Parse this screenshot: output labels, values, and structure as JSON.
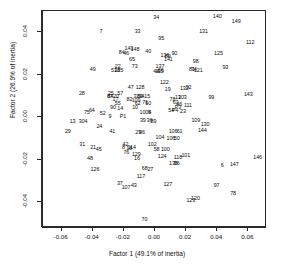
{
  "chart_data": {
    "type": "scatter",
    "title": "",
    "xlabel": "Factor 1 (49.1% of inertia)",
    "ylabel": "Factor 2 (26.9% of inertia)",
    "xlim": [
      -0.072,
      0.072
    ],
    "ylim": [
      -0.052,
      0.05
    ],
    "xticks": [
      -0.06,
      -0.04,
      -0.02,
      0.0,
      0.02,
      0.04,
      0.06
    ],
    "xticklabels": [
      "-0.06",
      "-0.04",
      "-0.02",
      "0.00",
      "0.02",
      "0.04",
      "0.06"
    ],
    "yticks": [
      -0.04,
      -0.02,
      0.0,
      0.02,
      0.04
    ],
    "yticklabels": [
      "-0.04",
      "-0.02",
      "0.00",
      "0.02",
      "0.04"
    ],
    "grid": false,
    "legend": false,
    "point_style": "text-labels",
    "points": [
      {
        "label": "34",
        "x": 0.0008,
        "y": 0.0468
      },
      {
        "label": "140",
        "x": 0.04,
        "y": 0.047
      },
      {
        "label": "149",
        "x": 0.0522,
        "y": 0.045
      },
      {
        "label": "7",
        "x": -0.0348,
        "y": 0.04
      },
      {
        "label": "33",
        "x": -0.0112,
        "y": 0.0402
      },
      {
        "label": "131",
        "x": 0.0312,
        "y": 0.04
      },
      {
        "label": "95",
        "x": 0.004,
        "y": 0.037
      },
      {
        "label": "112",
        "x": 0.0612,
        "y": 0.0348
      },
      {
        "label": "143",
        "x": -0.0168,
        "y": 0.032
      },
      {
        "label": "148",
        "x": -0.0128,
        "y": 0.0318
      },
      {
        "label": "84",
        "x": -0.0214,
        "y": 0.0302
      },
      {
        "label": "46",
        "x": -0.0186,
        "y": 0.03
      },
      {
        "label": "40",
        "x": -0.0044,
        "y": 0.0305
      },
      {
        "label": "136",
        "x": 0.0063,
        "y": 0.0288
      },
      {
        "label": "89",
        "x": 0.0082,
        "y": 0.0284
      },
      {
        "label": "90",
        "x": 0.0124,
        "y": 0.0296
      },
      {
        "label": "125",
        "x": 0.0408,
        "y": 0.03
      },
      {
        "label": "65",
        "x": -0.0148,
        "y": 0.0268
      },
      {
        "label": "141",
        "x": 0.0086,
        "y": 0.0268
      },
      {
        "label": "98",
        "x": 0.0262,
        "y": 0.0258
      },
      {
        "label": "22",
        "x": -0.024,
        "y": 0.0238
      },
      {
        "label": "73",
        "x": -0.013,
        "y": 0.0236
      },
      {
        "label": "137",
        "x": 0.0032,
        "y": 0.0238
      },
      {
        "label": "93",
        "x": 0.0452,
        "y": 0.0232
      },
      {
        "label": "49",
        "x": -0.04,
        "y": 0.0224
      },
      {
        "label": "51",
        "x": -0.0264,
        "y": 0.0218
      },
      {
        "label": "38",
        "x": -0.0244,
        "y": 0.0218
      },
      {
        "label": "35",
        "x": -0.0224,
        "y": 0.0216
      },
      {
        "label": "81",
        "x": 0.0238,
        "y": 0.0222
      },
      {
        "label": "74",
        "x": 0.025,
        "y": 0.0222
      },
      {
        "label": "121",
        "x": 0.0278,
        "y": 0.0218
      },
      {
        "label": "44",
        "x": 0.0008,
        "y": 0.0212
      },
      {
        "label": "66",
        "x": 0.0038,
        "y": 0.0216
      },
      {
        "label": "115",
        "x": 0.0028,
        "y": 0.0214
      },
      {
        "label": "122",
        "x": 0.006,
        "y": 0.016
      },
      {
        "label": "47",
        "x": -0.0156,
        "y": 0.014
      },
      {
        "label": "128",
        "x": -0.0096,
        "y": 0.014
      },
      {
        "label": "19",
        "x": 0.0082,
        "y": 0.0128
      },
      {
        "label": "132",
        "x": 0.0188,
        "y": 0.0132
      },
      {
        "label": "92",
        "x": 0.0216,
        "y": 0.0136
      },
      {
        "label": "28",
        "x": -0.047,
        "y": 0.0108
      },
      {
        "label": "25",
        "x": -0.0284,
        "y": 0.0108
      },
      {
        "label": "57",
        "x": -0.0224,
        "y": 0.0108
      },
      {
        "label": "20",
        "x": -0.025,
        "y": 0.0096
      },
      {
        "label": "143b",
        "x": 0.06,
        "y": 0.0104
      },
      {
        "label": "32",
        "x": -0.012,
        "y": 0.0098
      },
      {
        "label": "60",
        "x": -0.0096,
        "y": 0.0096
      },
      {
        "label": "94",
        "x": -0.0086,
        "y": 0.0094
      },
      {
        "label": "15",
        "x": -0.005,
        "y": 0.0098
      },
      {
        "label": "99",
        "x": 0.0362,
        "y": 0.0092
      },
      {
        "label": "67",
        "x": -0.029,
        "y": 0.0098
      },
      {
        "label": "84b",
        "x": -0.0286,
        "y": 0.0094
      },
      {
        "label": "17",
        "x": -0.0254,
        "y": 0.008
      },
      {
        "label": "82",
        "x": -0.0164,
        "y": 0.008
      },
      {
        "label": "109",
        "x": -0.0122,
        "y": 0.0076
      },
      {
        "label": "78",
        "x": 0.0112,
        "y": 0.0082
      },
      {
        "label": "13b",
        "x": 0.0148,
        "y": 0.009
      },
      {
        "label": "103",
        "x": 0.0176,
        "y": 0.009
      },
      {
        "label": "55",
        "x": -0.024,
        "y": 0.0064
      },
      {
        "label": "62",
        "x": -0.0112,
        "y": 0.0062
      },
      {
        "label": "71",
        "x": -0.0064,
        "y": 0.0066
      },
      {
        "label": "50",
        "x": -0.0044,
        "y": 0.0062
      },
      {
        "label": "63",
        "x": 0.0132,
        "y": 0.0068
      },
      {
        "label": "46b",
        "x": 0.0156,
        "y": 0.0056
      },
      {
        "label": "111",
        "x": 0.0212,
        "y": 0.0054
      },
      {
        "label": "90b",
        "x": -0.027,
        "y": 0.0044
      },
      {
        "label": "14",
        "x": -0.0224,
        "y": 0.0038
      },
      {
        "label": "10",
        "x": -0.0128,
        "y": 0.0042
      },
      {
        "label": "54",
        "x": 0.0104,
        "y": 0.0028
      },
      {
        "label": "P3",
        "x": 0.0148,
        "y": 0.0044
      },
      {
        "label": "P4",
        "x": 0.0128,
        "y": 0.003
      },
      {
        "label": "23",
        "x": 0.018,
        "y": 0.0026
      },
      {
        "label": "75",
        "x": -0.0438,
        "y": 0.0022
      },
      {
        "label": "64",
        "x": -0.0406,
        "y": 0.0028
      },
      {
        "label": "52",
        "x": -0.0336,
        "y": 0.0018
      },
      {
        "label": "1004",
        "x": -0.0062,
        "y": 0.0022
      },
      {
        "label": "5",
        "x": -0.0036,
        "y": 0.0022
      },
      {
        "label": "P1",
        "x": -0.0206,
        "y": 0.0004
      },
      {
        "label": "9",
        "x": -0.029,
        "y": 0.0
      },
      {
        "label": "13",
        "x": -0.053,
        "y": -0.0022
      },
      {
        "label": "304",
        "x": -0.0462,
        "y": -0.0024
      },
      {
        "label": "24",
        "x": -0.0358,
        "y": -0.0046
      },
      {
        "label": "39",
        "x": -0.0078,
        "y": -0.0016
      },
      {
        "label": "36",
        "x": -0.0036,
        "y": -0.0018
      },
      {
        "label": "89b",
        "x": -0.001,
        "y": -0.002
      },
      {
        "label": "109b",
        "x": 0.0262,
        "y": -0.0016
      },
      {
        "label": "130",
        "x": 0.0322,
        "y": -0.0036
      },
      {
        "label": "29",
        "x": -0.056,
        "y": -0.007
      },
      {
        "label": "41",
        "x": -0.0274,
        "y": -0.0068
      },
      {
        "label": "29b",
        "x": -0.0108,
        "y": -0.0072
      },
      {
        "label": "96",
        "x": -0.0084,
        "y": -0.0074
      },
      {
        "label": "106",
        "x": 0.0116,
        "y": -0.007
      },
      {
        "label": "61",
        "x": 0.0158,
        "y": -0.0068
      },
      {
        "label": "144",
        "x": 0.0304,
        "y": -0.0062
      },
      {
        "label": "104",
        "x": 0.0032,
        "y": -0.0098
      },
      {
        "label": "106b",
        "x": 0.0102,
        "y": -0.01
      },
      {
        "label": "50b",
        "x": 0.014,
        "y": -0.0102
      },
      {
        "label": "31",
        "x": -0.0468,
        "y": -0.0128
      },
      {
        "label": "21",
        "x": -0.0398,
        "y": -0.0144
      },
      {
        "label": "45",
        "x": -0.0362,
        "y": -0.0152
      },
      {
        "label": "42",
        "x": -0.019,
        "y": -0.0132
      },
      {
        "label": "114",
        "x": -0.015,
        "y": -0.0142
      },
      {
        "label": "102",
        "x": -0.0018,
        "y": -0.0132
      },
      {
        "label": "8",
        "x": -0.0202,
        "y": -0.0146
      },
      {
        "label": "18",
        "x": -0.0166,
        "y": -0.015
      },
      {
        "label": "58",
        "x": 0.001,
        "y": -0.0154
      },
      {
        "label": "100",
        "x": 0.0066,
        "y": -0.0152
      },
      {
        "label": "76",
        "x": -0.0184,
        "y": -0.0166
      },
      {
        "label": "129",
        "x": -0.012,
        "y": -0.0176
      },
      {
        "label": "124",
        "x": 0.0046,
        "y": -0.0184
      },
      {
        "label": "118",
        "x": 0.0148,
        "y": -0.019
      },
      {
        "label": "101",
        "x": 0.0198,
        "y": -0.018
      },
      {
        "label": "48",
        "x": -0.0418,
        "y": -0.0196
      },
      {
        "label": "16",
        "x": -0.0116,
        "y": -0.0198
      },
      {
        "label": "146",
        "x": 0.066,
        "y": -0.019
      },
      {
        "label": "135",
        "x": 0.0118,
        "y": -0.0218
      },
      {
        "label": "96b",
        "x": 0.014,
        "y": -0.022
      },
      {
        "label": "6",
        "x": 0.0432,
        "y": -0.0228
      },
      {
        "label": "147",
        "x": 0.051,
        "y": -0.0226
      },
      {
        "label": "126",
        "x": -0.0386,
        "y": -0.0248
      },
      {
        "label": "68",
        "x": -0.0066,
        "y": -0.0244
      },
      {
        "label": "27",
        "x": -0.003,
        "y": -0.0246
      },
      {
        "label": "117",
        "x": -0.009,
        "y": -0.0282
      },
      {
        "label": "37",
        "x": -0.0226,
        "y": -0.0314
      },
      {
        "label": "43",
        "x": -0.0136,
        "y": -0.0324
      },
      {
        "label": "107",
        "x": -0.0186,
        "y": -0.0332
      },
      {
        "label": "127",
        "x": 0.0082,
        "y": -0.032
      },
      {
        "label": "97",
        "x": 0.0396,
        "y": -0.0322
      },
      {
        "label": "78b",
        "x": 0.0502,
        "y": -0.0362
      },
      {
        "label": "123",
        "x": 0.023,
        "y": -0.0392
      },
      {
        "label": "120",
        "x": 0.026,
        "y": -0.0384
      },
      {
        "label": "70",
        "x": -0.0068,
        "y": -0.0484
      }
    ]
  }
}
